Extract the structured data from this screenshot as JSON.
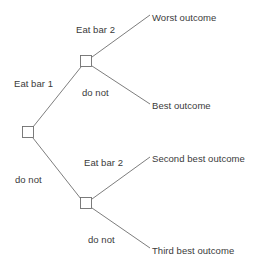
{
  "figure": {
    "type": "decision-tree",
    "background_color": "#ffffff",
    "line_color": "#6e6e6e",
    "text_color": "#3a3a3a",
    "node_fill": "#ffffff"
  },
  "nodes": [
    {
      "id": "root",
      "name": "root-decision-node",
      "x": 28,
      "y": 132
    },
    {
      "id": "upper",
      "name": "upper-decision-node",
      "x": 86,
      "y": 61
    },
    {
      "id": "lower",
      "name": "lower-decision-node",
      "x": 86,
      "y": 203
    }
  ],
  "branches": [
    {
      "id": "eat-bar-1",
      "label": "Eat bar 1",
      "from": "root",
      "to": "upper",
      "label_x": 14,
      "label_y": 78
    },
    {
      "id": "do-not-1",
      "label": "do not",
      "from": "root",
      "to": "lower",
      "label_x": 15,
      "label_y": 174
    },
    {
      "id": "eat-bar-2-upper",
      "label": "Eat bar 2",
      "from": "upper",
      "to": "worst-outcome",
      "label_x": 76,
      "label_y": 24
    },
    {
      "id": "do-not-upper",
      "label": "do not",
      "from": "upper",
      "to": "best-outcome",
      "label_x": 82,
      "label_y": 87
    },
    {
      "id": "eat-bar-2-lower",
      "label": "Eat bar 2",
      "from": "lower",
      "to": "second-best",
      "label_x": 84,
      "label_y": 157
    },
    {
      "id": "do-not-lower",
      "label": "do not",
      "from": "lower",
      "to": "third-best",
      "label_x": 88,
      "label_y": 234
    }
  ],
  "outcomes": [
    {
      "id": "worst-outcome",
      "label": "Worst outcome",
      "x": 152,
      "y": 12
    },
    {
      "id": "best-outcome",
      "label": "Best outcome",
      "x": 152,
      "y": 100
    },
    {
      "id": "second-best",
      "label": "Second best outcome",
      "x": 152,
      "y": 153
    },
    {
      "id": "third-best",
      "label": "Third best outcome",
      "x": 152,
      "y": 245
    }
  ]
}
